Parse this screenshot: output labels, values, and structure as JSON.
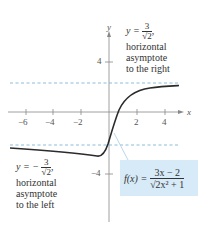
{
  "figure": {
    "function_label": "f(x) =",
    "function_numerator": "3x − 2",
    "function_denominator": "√2x² + 1",
    "axes": {
      "x_name": "x",
      "y_name": "y",
      "x_ticks": [
        "−6",
        "−4",
        "−2",
        "2",
        "4"
      ],
      "y_ticks": [
        "4",
        "−4"
      ]
    },
    "right_asymptote": {
      "prefix": "y =",
      "numerator": "3",
      "denominator": "√2",
      "suffix": ",",
      "line1": "horizontal",
      "line2": "asymptote",
      "line3": "to the right"
    },
    "left_asymptote": {
      "prefix": "y = −",
      "numerator": "3",
      "denominator": "√2",
      "suffix": ",",
      "line1": "horizontal",
      "line2": "asymptote",
      "line3": "to the left"
    },
    "colors": {
      "curve": "#2b2b2b",
      "asymptote": "#7fb3d5",
      "formula_box": "#d6eaf7",
      "axis": "#888888"
    }
  }
}
